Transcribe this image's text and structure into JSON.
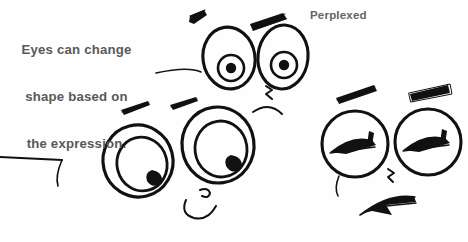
{
  "page": {
    "width": 468,
    "height": 242,
    "background_color": "#fefefe",
    "ink_color": "#111111",
    "text_color": "#595959",
    "medium": "hand-drawn ink sketch"
  },
  "captions": {
    "instruction": "Eyes can change\nshape based on\nthe expression.",
    "instruction_line1": "Eyes can change",
    "instruction_line2": "shape based on",
    "instruction_line3": "the expression.",
    "expression_label": "Perplexed"
  },
  "drawing": {
    "title": "Three cartoon faces showing different eye shapes",
    "faces": [
      {
        "name": "top-center-face",
        "expression": "surprised / wide-eyed",
        "eye_shape": "large tilted ovals",
        "pupil_style": "concentric iris ring with solid dark center",
        "has_eyebrows": true,
        "eyebrow_style": "thick angled slashes",
        "has_nose": true,
        "has_mouth": true,
        "mouth_style": "wavy downturned curve"
      },
      {
        "name": "lower-left-face",
        "expression": "looking aside / puzzled",
        "eye_shape": "large nested ovals",
        "pupil_style": "crescent shaded pupil at lower right",
        "has_eyebrows": true,
        "eyebrow_style": "thin tapered strokes",
        "has_nose": true,
        "has_mouth": true,
        "mouth_style": "small curled lip"
      },
      {
        "name": "right-face",
        "expression": "squinting / perplexed",
        "eye_shape": "round circles",
        "pupil_style": "narrow closed-lid wedge with upward tick",
        "has_eyebrows": true,
        "eyebrow_style": "thick angled slashes",
        "has_nose": true,
        "has_mouth": true,
        "mouth_style": "angular frown"
      }
    ]
  }
}
